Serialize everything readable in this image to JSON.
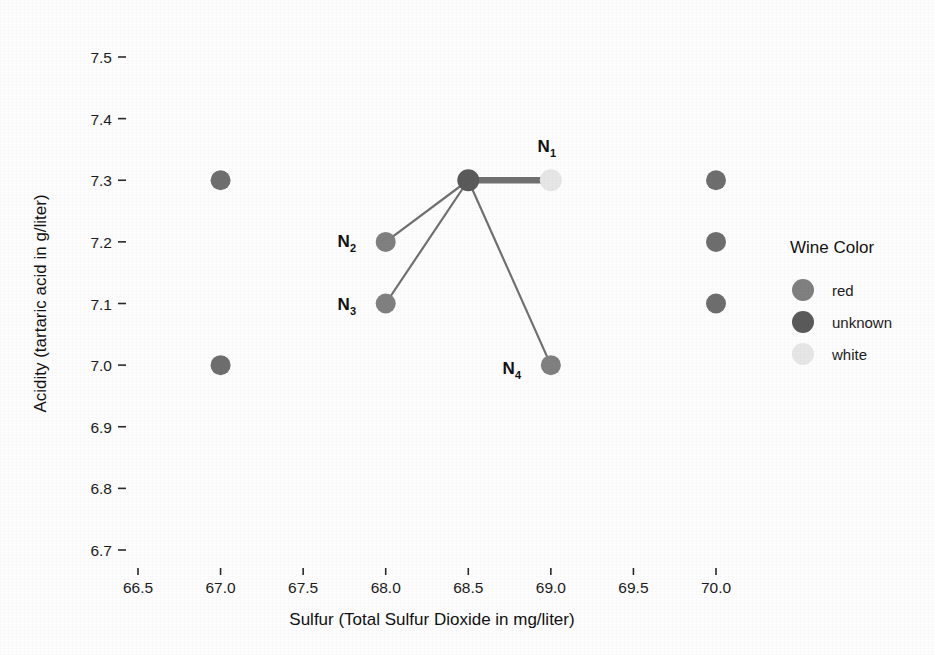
{
  "chart_data": {
    "type": "scatter",
    "title": "",
    "xlabel": "Sulfur (Total Sulfur Dioxide  in mg/liter)",
    "ylabel": "Acidity (tartaric acid in g/liter)",
    "xlim": [
      66.32,
      70.22
    ],
    "ylim": [
      6.66,
      7.55
    ],
    "grid": false,
    "xticks": [
      "66.5",
      "67.0",
      "67.5",
      "68.0",
      "68.5",
      "69.0",
      "69.5",
      "70.0"
    ],
    "xtick_values": [
      66.5,
      67.0,
      67.5,
      68.0,
      68.5,
      69.0,
      69.5,
      70.0
    ],
    "yticks": [
      "6.7",
      "6.8",
      "6.9",
      "7.0",
      "7.1",
      "7.2",
      "7.3",
      "7.4",
      "7.5"
    ],
    "ytick_values": [
      6.7,
      6.8,
      6.9,
      7.0,
      7.1,
      7.2,
      7.3,
      7.4,
      7.5
    ],
    "legend": {
      "title": "Wine Color",
      "position": "right",
      "entries": [
        {
          "label": "red",
          "color": "#808080"
        },
        {
          "label": "unknown",
          "color": "#5a5a5a"
        },
        {
          "label": "white",
          "color": "#e6e6e6"
        }
      ]
    },
    "points": [
      {
        "id": "p-hub",
        "x": 68.5,
        "y": 7.3,
        "color": "#5a5a5a",
        "group": "unknown",
        "label": "",
        "r": 11
      },
      {
        "id": "p-n1",
        "x": 69.0,
        "y": 7.3,
        "color": "#e6e6e6",
        "group": "white",
        "label": "N1",
        "r": 11
      },
      {
        "id": "p-n2",
        "x": 68.0,
        "y": 7.2,
        "color": "#808080",
        "group": "red",
        "label": "N2",
        "r": 10
      },
      {
        "id": "p-n3",
        "x": 68.0,
        "y": 7.1,
        "color": "#808080",
        "group": "red",
        "label": "N3",
        "r": 10
      },
      {
        "id": "p-n4",
        "x": 69.0,
        "y": 7.0,
        "color": "#808080",
        "group": "red",
        "label": "N4",
        "r": 10
      },
      {
        "id": "p-a",
        "x": 67.0,
        "y": 7.3,
        "color": "#6e6e6e",
        "group": "red",
        "label": "",
        "r": 10
      },
      {
        "id": "p-b",
        "x": 67.0,
        "y": 7.0,
        "color": "#6e6e6e",
        "group": "red",
        "label": "",
        "r": 10
      },
      {
        "id": "p-c",
        "x": 70.0,
        "y": 7.3,
        "color": "#6e6e6e",
        "group": "red",
        "label": "",
        "r": 10
      },
      {
        "id": "p-d",
        "x": 70.0,
        "y": 7.2,
        "color": "#6e6e6e",
        "group": "red",
        "label": "",
        "r": 10
      },
      {
        "id": "p-e",
        "x": 70.0,
        "y": 7.1,
        "color": "#6e6e6e",
        "group": "red",
        "label": "",
        "r": 10
      }
    ],
    "edges": [
      {
        "id": "e-hub-n1",
        "from": "p-hub",
        "to": "p-n1",
        "width": 6.5,
        "color": "#707070"
      },
      {
        "id": "e-hub-n2",
        "from": "p-hub",
        "to": "p-n2",
        "width": 2.2,
        "color": "#707070"
      },
      {
        "id": "e-hub-n3",
        "from": "p-hub",
        "to": "p-n3",
        "width": 2.2,
        "color": "#707070"
      },
      {
        "id": "e-hub-n4",
        "from": "p-hub",
        "to": "p-n4",
        "width": 2.2,
        "color": "#707070"
      }
    ],
    "node_labels": [
      {
        "id": "lbl-n1",
        "base": "N",
        "sub": "1",
        "x": 556,
        "y": 152
      },
      {
        "id": "lbl-n2",
        "base": "N",
        "sub": "2",
        "x": 356,
        "y": 247
      },
      {
        "id": "lbl-n3",
        "base": "N",
        "sub": "3",
        "x": 356,
        "y": 310
      },
      {
        "id": "lbl-n4",
        "base": "N",
        "sub": "4",
        "x": 521,
        "y": 374
      }
    ]
  }
}
